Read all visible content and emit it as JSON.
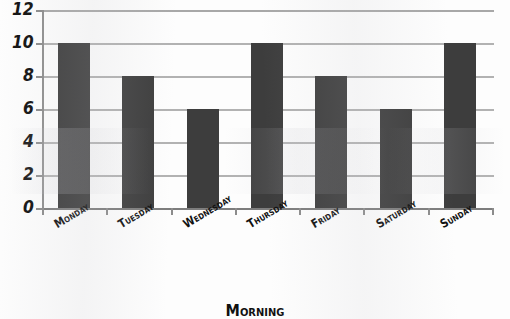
{
  "chart_data": {
    "type": "bar",
    "title": "",
    "subtitle": "",
    "xlabel": "Morning",
    "ylabel": "",
    "categories": [
      "Monday",
      "Tuesday",
      "Wednesday",
      "Thursday",
      "Friday",
      "Saturday",
      "Sunday"
    ],
    "values": [
      10,
      8,
      6,
      10,
      8,
      6,
      10
    ],
    "ylim": [
      0,
      12
    ],
    "ytick_values": [
      0,
      2,
      4,
      6,
      8,
      10,
      12
    ],
    "ytick_labels": [
      "0",
      "2",
      "4",
      "6",
      "8",
      "10",
      "12"
    ],
    "grid": true,
    "grid_axis": "y",
    "legend": false,
    "legend_position": "none",
    "bar_color": "#3d3d3d",
    "gridline_color": "#b2b2b2",
    "axis_color": "#8c8c8c",
    "background_color": "#fdfdfd",
    "bar_width_ratio": 0.5,
    "xtick_rotation": -31
  },
  "axes": {
    "y_labels": [
      "12",
      "10",
      "8",
      "6",
      "4",
      "2",
      "0"
    ],
    "x_labels": [
      "Monday",
      "Tuesday",
      "Wednesday",
      "Thursday",
      "Friday",
      "Saturday",
      "Sunday"
    ],
    "x_axis_title": "Morning"
  }
}
